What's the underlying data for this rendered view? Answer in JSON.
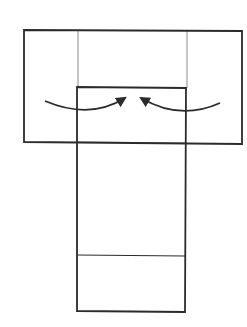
{
  "diagram": {
    "title": "",
    "colors": {
      "background": "#ffffff",
      "stroke": "#2b2b2b",
      "thin_stroke": "#8a8a8a"
    },
    "shapes": {
      "outer_rect": {
        "x": 24,
        "y": 30,
        "w": 218,
        "h": 113
      },
      "inner_rect": {
        "x": 77,
        "y": 87,
        "w": 108,
        "h": 225
      },
      "thin_left": {
        "x": 78,
        "y1": 30,
        "y2": 87
      },
      "thin_right": {
        "x": 187,
        "y1": 31,
        "y2": 143
      },
      "inner_top_section_line": {
        "y": 143
      },
      "inner_divider": {
        "y": 255
      }
    },
    "arrows": [
      {
        "name": "left-arrow",
        "direction": "inward-right"
      },
      {
        "name": "right-arrow",
        "direction": "inward-left"
      }
    ]
  }
}
